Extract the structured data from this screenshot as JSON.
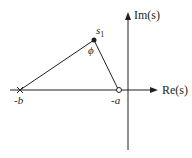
{
  "diagram": {
    "type": "s-plane pole-zero geometry",
    "axes": {
      "real_label": "Re(s)",
      "imag_label": "Im(s)"
    },
    "points": [
      {
        "id": "s1",
        "label": "s1",
        "label_main": "s",
        "label_sub": "1",
        "marker": "filled-dot"
      },
      {
        "id": "minus_a",
        "label": "-a",
        "marker": "open-circle"
      },
      {
        "id": "minus_b",
        "label": "-b",
        "marker": "cross"
      }
    ],
    "angle_label": "ϕ",
    "colors": {
      "line": "#231f20",
      "background": "#ffffff"
    }
  }
}
